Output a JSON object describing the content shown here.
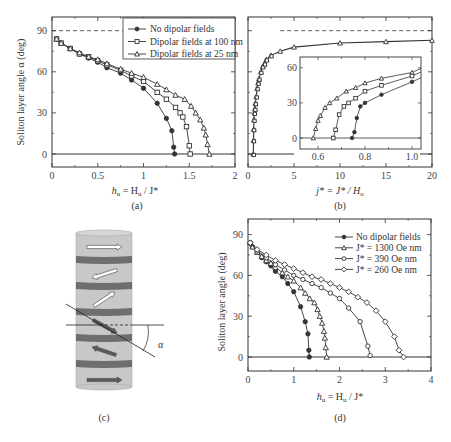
{
  "chart_data": [
    {
      "panel": "(a)",
      "type": "scatter",
      "xlabel": "h_u = H_u / J*",
      "ylabel": "Soliton layer angle α (deg)",
      "xlim": [
        0,
        2
      ],
      "ylim": [
        -10,
        100
      ],
      "xticks": [
        "0",
        "0.5",
        "1",
        "1.5",
        "2"
      ],
      "yticks": [
        "0",
        "30",
        "60",
        "90"
      ],
      "reference_line_dashed": 90,
      "reference_line_solid": 0,
      "legend_position": "upper right",
      "series": [
        {
          "name": "No dipolar fields",
          "marker": "filled-circle",
          "x": [
            0.05,
            0.1,
            0.2,
            0.3,
            0.4,
            0.5,
            0.6,
            0.75,
            0.87,
            1.0,
            1.15,
            1.25,
            1.31,
            1.33,
            1.34
          ],
          "y": [
            84,
            81,
            77,
            73,
            70,
            67,
            63,
            59,
            54,
            48,
            37,
            26,
            17,
            5,
            0
          ]
        },
        {
          "name": "Dipolar fields at 100 nm",
          "marker": "open-square",
          "x": [
            0.05,
            0.1,
            0.2,
            0.3,
            0.4,
            0.5,
            0.6,
            0.75,
            0.87,
            1.0,
            1.15,
            1.25,
            1.35,
            1.4,
            1.43,
            1.47,
            1.5,
            1.51
          ],
          "y": [
            84,
            81,
            77,
            73,
            71,
            68,
            65,
            61,
            57,
            53,
            45,
            40,
            34,
            30,
            27,
            20,
            6,
            0
          ]
        },
        {
          "name": "Dipolar fields at 25 nm",
          "marker": "open-triangle",
          "x": [
            0.05,
            0.1,
            0.2,
            0.3,
            0.4,
            0.5,
            0.6,
            0.75,
            0.87,
            1.0,
            1.15,
            1.25,
            1.35,
            1.45,
            1.52,
            1.57,
            1.62,
            1.66,
            1.68,
            1.7,
            1.72
          ],
          "y": [
            84,
            81,
            77,
            74,
            71,
            69,
            66,
            62,
            59,
            56,
            51,
            47,
            43,
            40,
            35,
            30,
            25,
            19,
            14,
            7,
            0
          ]
        }
      ]
    },
    {
      "panel": "(b)",
      "type": "scatter",
      "xlabel": "j* = J* / H_u",
      "ylabel": "",
      "xlim": [
        0,
        20
      ],
      "ylim": [
        -10,
        100
      ],
      "xticks": [
        "0",
        "5",
        "10",
        "15",
        "20"
      ],
      "yticks": [
        "0",
        "30",
        "60",
        "90"
      ],
      "reference_line_dashed": 90,
      "main_curve": {
        "x": [
          0.58,
          0.6,
          0.62,
          0.65,
          0.7,
          0.75,
          0.8,
          0.9,
          1.0,
          1.1,
          1.2,
          1.4,
          1.6,
          1.8,
          2.0,
          2.5,
          3.5,
          5,
          10,
          15,
          20
        ],
        "y": [
          0,
          10,
          18,
          25,
          30,
          33,
          37,
          42,
          48,
          52,
          55,
          60,
          64,
          66,
          69,
          72,
          75,
          78,
          81,
          82,
          83
        ]
      },
      "inset": {
        "xlim": [
          0.55,
          1.05
        ],
        "ylim": [
          -15,
          70
        ],
        "xticks": [
          "0.6",
          "0.8",
          "1.0"
        ],
        "yticks": [
          "0",
          "30",
          "60"
        ],
        "series": [
          {
            "name": "Dipolar fields at 25 nm",
            "marker": "open-triangle",
            "x": [
              0.58,
              0.59,
              0.6,
              0.61,
              0.63,
              0.65,
              0.68,
              0.72,
              0.76,
              0.8,
              0.87,
              1.0
            ],
            "y": [
              0,
              8,
              15,
              19,
              26,
              30,
              34,
              40,
              43,
              47,
              51,
              56
            ]
          },
          {
            "name": "Dipolar fields at 100 nm",
            "marker": "open-square",
            "x": [
              0.665,
              0.675,
              0.69,
              0.71,
              0.73,
              0.76,
              0.8,
              0.87,
              1.0
            ],
            "y": [
              0,
              7,
              20,
              27,
              30,
              34,
              40,
              45,
              53
            ]
          },
          {
            "name": "No dipolar fields",
            "marker": "filled-circle",
            "x": [
              0.745,
              0.755,
              0.765,
              0.78,
              0.8,
              0.87,
              1.0
            ],
            "y": [
              0,
              5,
              17,
              27,
              30,
              37,
              48
            ]
          }
        ]
      }
    },
    {
      "panel": "(d)",
      "type": "scatter",
      "xlabel": "h_u = H_u / J*",
      "ylabel": "Soliton layer angle (deg)",
      "xlim": [
        0,
        4
      ],
      "ylim": [
        -10,
        100
      ],
      "xticks": [
        "0",
        "1",
        "2",
        "3",
        "4"
      ],
      "yticks": [
        "0",
        "30",
        "60",
        "90"
      ],
      "reference_line_solid": 0,
      "legend_position": "upper right",
      "series": [
        {
          "name": "No dipolar fields",
          "marker": "filled-circle",
          "x": [
            0.05,
            0.1,
            0.2,
            0.3,
            0.4,
            0.5,
            0.6,
            0.75,
            0.87,
            1.0,
            1.15,
            1.25,
            1.31,
            1.33,
            1.34
          ],
          "y": [
            84,
            81,
            77,
            73,
            70,
            67,
            63,
            59,
            54,
            48,
            37,
            26,
            17,
            5,
            0
          ]
        },
        {
          "name": "J* = 1300 Oe nm",
          "marker": "open-triangle",
          "x": [
            0.05,
            0.1,
            0.2,
            0.3,
            0.4,
            0.5,
            0.6,
            0.75,
            0.87,
            1.0,
            1.15,
            1.25,
            1.35,
            1.45,
            1.52,
            1.57,
            1.62,
            1.66,
            1.68,
            1.7,
            1.72
          ],
          "y": [
            84,
            81,
            77,
            74,
            71,
            69,
            66,
            62,
            59,
            56,
            51,
            47,
            43,
            40,
            35,
            30,
            25,
            19,
            14,
            7,
            0
          ]
        },
        {
          "name": "J* = 390 Oe nm",
          "marker": "open-circle",
          "x": [
            0.05,
            0.2,
            0.4,
            0.6,
            0.8,
            1.0,
            1.2,
            1.4,
            1.6,
            1.8,
            2.0,
            2.2,
            2.45,
            2.62,
            2.67
          ],
          "y": [
            84,
            78,
            73,
            68,
            64,
            60,
            57,
            54,
            51,
            47,
            43,
            36,
            26,
            8,
            1
          ]
        },
        {
          "name": "J* = 260 Oe nm",
          "marker": "open-diamond",
          "x": [
            0.05,
            0.2,
            0.4,
            0.6,
            0.8,
            1.0,
            1.2,
            1.4,
            1.6,
            1.8,
            2.0,
            2.2,
            2.4,
            2.6,
            2.8,
            3.0,
            3.2,
            3.3,
            3.4
          ],
          "y": [
            84,
            79,
            75,
            71,
            68,
            65,
            62,
            59,
            57,
            54,
            51,
            48,
            44,
            40,
            34,
            26,
            15,
            5,
            0
          ]
        }
      ]
    }
  ],
  "panels": {
    "a": {
      "label": "(a)",
      "ylabel": "Soliton layer angle α (deg)",
      "xlabel_main": "h",
      "xlabel_sub": "u",
      "xlabel_rest": " = H",
      "xlabel_sub2": "u",
      "xlabel_end": " / J*",
      "xticks": [
        "0",
        "0.5",
        "1",
        "1.5",
        "2"
      ],
      "yticks": [
        "0",
        "30",
        "60",
        "90"
      ],
      "legend": [
        "No dipolar fields",
        "Dipolar fields at 100 nm",
        "Dipolar fields at 25 nm"
      ]
    },
    "b": {
      "label": "(b)",
      "xlabel_main": "j* = J* / H",
      "xlabel_sub": "u",
      "xticks": [
        "0",
        "5",
        "10",
        "15",
        "20"
      ],
      "inset_xticks": [
        "0.6",
        "0.8",
        "1.0"
      ],
      "inset_yticks": [
        "0",
        "30",
        "60"
      ]
    },
    "c": {
      "label": "(c)",
      "angle_symbol": "α"
    },
    "d": {
      "label": "(d)",
      "ylabel": "Soliton layer angle (deg)",
      "xlabel_main": "h",
      "xlabel_sub": "u",
      "xlabel_rest": " = H",
      "xlabel_sub2": "u",
      "xlabel_end": " / J*",
      "xticks": [
        "0",
        "1",
        "2",
        "3",
        "4"
      ],
      "yticks": [
        "0",
        "30",
        "60",
        "90"
      ],
      "legend": [
        "No dipolar fields",
        "J* = 1300 Oe nm",
        "J* = 390 Oe nm",
        "J* = 260 Oe nm"
      ]
    }
  },
  "colors": {
    "line": "#333333",
    "cylinder_fill": "#c8c8c8",
    "cylinder_band": "#6e6e6e",
    "arrow_dark": "#5a5a5a",
    "arrow_light": "#ffffff"
  }
}
